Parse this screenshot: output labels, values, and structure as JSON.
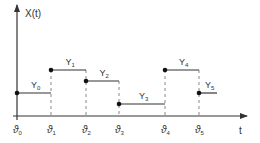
{
  "diagram": {
    "type": "step-function",
    "y_axis_label": "X(t)",
    "x_axis_label": "t",
    "colors": {
      "line": "#333333",
      "dashed": "#888888",
      "background": "#ffffff"
    },
    "ticks": [
      {
        "label": "ϑ",
        "sub": "0",
        "x": 17
      },
      {
        "label": "ϑ",
        "sub": "1",
        "x": 51
      },
      {
        "label": "ϑ",
        "sub": "2",
        "x": 86
      },
      {
        "label": "ϑ",
        "sub": "3",
        "x": 119
      },
      {
        "label": "ϑ",
        "sub": "4",
        "x": 165
      },
      {
        "label": "ϑ",
        "sub": "5",
        "x": 199
      }
    ],
    "segments": [
      {
        "label": "Y",
        "sub": "0",
        "x1": 17,
        "x2": 51,
        "y": 93
      },
      {
        "label": "Y",
        "sub": "1",
        "x1": 51,
        "x2": 86,
        "y": 70
      },
      {
        "label": "Y",
        "sub": "2",
        "x1": 86,
        "x2": 119,
        "y": 81
      },
      {
        "label": "Y",
        "sub": "3",
        "x1": 119,
        "x2": 165,
        "y": 104
      },
      {
        "label": "Y",
        "sub": "4",
        "x1": 165,
        "x2": 199,
        "y": 70
      },
      {
        "label": "Y",
        "sub": "5",
        "x1": 199,
        "x2": 217,
        "y": 93
      }
    ]
  }
}
